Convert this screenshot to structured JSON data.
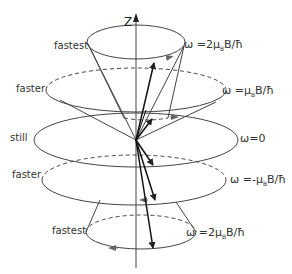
{
  "diagram": {
    "title": "",
    "axis": {
      "label": "Z"
    },
    "colors": {
      "stroke": "#333333",
      "background": "#ffffff"
    },
    "levels": [
      {
        "id": "top-fastest",
        "left_label": "fastest",
        "right_label": "ω = 2μₙB/ħ",
        "right_text": "ω =2μ",
        "right_sub": "B",
        "right_tail": "B/ħ"
      },
      {
        "id": "upper-faster",
        "left_label": "faster",
        "right_label": "ω = μₙB/ħ"
      },
      {
        "id": "still",
        "left_label": "still",
        "right_label": "ω=0"
      },
      {
        "id": "lower-faster",
        "left_label": "faster",
        "right_label": "ω = −μₙB/ħ"
      },
      {
        "id": "bottom-fastest",
        "left_label": "fastest",
        "right_label": "ω = 2μₙB/ħ"
      }
    ],
    "labels_left": [
      "fastest",
      "faster",
      "still",
      "faster",
      "fastest"
    ],
    "labels_right": {
      "top": {
        "pre": "ω =2μ",
        "sub": "B",
        "post": "B/ħ"
      },
      "upper": {
        "pre": "ω =μ",
        "sub": "B",
        "post": "B/ħ"
      },
      "still": {
        "text": "ω=0"
      },
      "lower": {
        "pre": "ω =-μ",
        "sub": "B",
        "post": "B/ħ"
      },
      "bottom": {
        "pre": "ω =2μ",
        "sub": "B",
        "post": "B/ħ"
      }
    }
  }
}
